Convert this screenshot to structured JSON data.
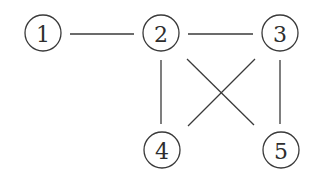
{
  "diagram": {
    "type": "graph",
    "nodes": [
      {
        "id": "1",
        "label": "1",
        "x": 43,
        "y": 33
      },
      {
        "id": "2",
        "label": "2",
        "x": 161,
        "y": 33
      },
      {
        "id": "3",
        "label": "3",
        "x": 280,
        "y": 33
      },
      {
        "id": "4",
        "label": "4",
        "x": 162,
        "y": 150
      },
      {
        "id": "5",
        "label": "5",
        "x": 281,
        "y": 150
      }
    ],
    "edges": [
      {
        "from": "1",
        "to": "2"
      },
      {
        "from": "2",
        "to": "3"
      },
      {
        "from": "2",
        "to": "4"
      },
      {
        "from": "3",
        "to": "5"
      },
      {
        "from": "2",
        "to": "5"
      },
      {
        "from": "3",
        "to": "4"
      }
    ],
    "node_radius": 18,
    "stroke_color": "#3a3a3a"
  }
}
